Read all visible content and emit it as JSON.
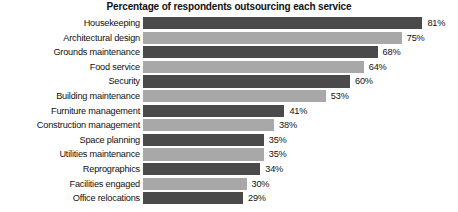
{
  "chart_data": {
    "type": "bar",
    "orientation": "horizontal",
    "title": "Percentage of respondents outsourcing each service",
    "xlabel": "",
    "ylabel": "",
    "xlim": [
      0,
      100
    ],
    "grid": false,
    "legend": "none",
    "value_suffix": "%",
    "categories": [
      "Housekeeping",
      "Architectural design",
      "Grounds maintenance",
      "Food service",
      "Security",
      "Building maintenance",
      "Furniture management",
      "Construction management",
      "Space planning",
      "Utilities maintenance",
      "Reprographics",
      "Facilities engaged",
      "Office relocations"
    ],
    "values": [
      81,
      75,
      68,
      64,
      60,
      53,
      41,
      38,
      35,
      35,
      34,
      30,
      29
    ],
    "value_labels": [
      "81%",
      "75%",
      "68%",
      "64%",
      "60%",
      "53%",
      "41%",
      "38%",
      "35%",
      "35%",
      "34%",
      "30%",
      "29%"
    ],
    "bar_colors": [
      "#4a4a4a",
      "#a8a8a8",
      "#4a4a4a",
      "#a8a8a8",
      "#4a4a4a",
      "#a8a8a8",
      "#4a4a4a",
      "#a8a8a8",
      "#4a4a4a",
      "#a8a8a8",
      "#4a4a4a",
      "#a8a8a8",
      "#4a4a4a"
    ],
    "colors": {
      "dark_bar": "#4a4a4a",
      "light_bar": "#a8a8a8",
      "background": "#ffffff",
      "text": "#111111"
    }
  }
}
